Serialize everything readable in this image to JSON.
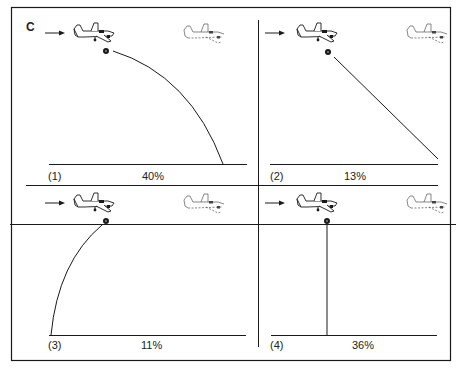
{
  "figure": {
    "panel_letter": "C"
  },
  "panels": [
    {
      "id": 1,
      "number_label": "(1)",
      "percent_label": "40%",
      "trajectory": "forward-curve",
      "percent": 40
    },
    {
      "id": 2,
      "number_label": "(2)",
      "percent_label": "13%",
      "trajectory": "forward-straight-diagonal",
      "percent": 13
    },
    {
      "id": 3,
      "number_label": "(3)",
      "percent_label": "11%",
      "trajectory": "backward-curve",
      "percent": 11
    },
    {
      "id": 4,
      "number_label": "(4)",
      "percent_label": "36%",
      "trajectory": "vertical-drop",
      "percent": 36
    }
  ],
  "icons": {
    "arrow": "direction-of-flight-arrow-icon",
    "aircraft_solid": "twin-engine-aircraft-icon",
    "aircraft_dashed": "aircraft-ghost-outline-icon",
    "dropped_object": "released-object-icon"
  },
  "colors": {
    "line": "#1a1a1a",
    "background": "#ffffff"
  }
}
